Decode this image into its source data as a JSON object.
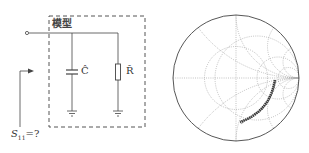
{
  "circuit": {
    "box_label": "模型",
    "capacitor_label": "Ĉ",
    "resistor_label": "R̂",
    "port_label": "S",
    "port_subscript": "11",
    "port_suffix": "=?"
  },
  "smith_chart": {
    "grid": "dotted",
    "trace": "measured S11 locus, lower-right arc"
  },
  "colors": {
    "line": "#444444",
    "grid": "#999999",
    "trace": "#333333"
  }
}
